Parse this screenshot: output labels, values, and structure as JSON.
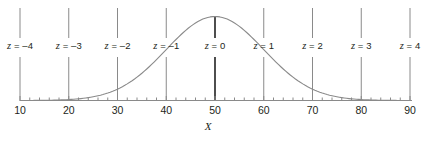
{
  "chart_data": {
    "type": "line",
    "title": "",
    "xlabel": "X",
    "ylabel": "",
    "xlim": [
      10,
      90
    ],
    "ylim": [
      0,
      1
    ],
    "grid": false,
    "legend": null,
    "curve": {
      "name": "normal-density",
      "mean": 50,
      "sd": 10,
      "color": "#8a8a8a"
    },
    "x_axis": {
      "major_ticks": [
        10,
        20,
        30,
        40,
        50,
        60,
        70,
        80,
        90
      ],
      "major_tick_labels": [
        "10",
        "20",
        "30",
        "40",
        "50",
        "60",
        "70",
        "80",
        "90"
      ],
      "minor_tick_step": 2,
      "color": "#8a8a8a"
    },
    "z_gridlines": [
      {
        "z": -4,
        "x": 10,
        "label_var": "z",
        "label_value": "= –4",
        "highlight": false
      },
      {
        "z": -3,
        "x": 20,
        "label_var": "z",
        "label_value": "= –3",
        "highlight": false
      },
      {
        "z": -2,
        "x": 30,
        "label_var": "z",
        "label_value": "= –2",
        "highlight": false
      },
      {
        "z": -1,
        "x": 40,
        "label_var": "z",
        "label_value": "= –1",
        "highlight": false
      },
      {
        "z": 0,
        "x": 50,
        "label_var": "z",
        "label_value": "= 0",
        "highlight": true
      },
      {
        "z": 1,
        "x": 60,
        "label_var": "z",
        "label_value": "= 1",
        "highlight": false
      },
      {
        "z": 2,
        "x": 70,
        "label_var": "z",
        "label_value": "= 2",
        "highlight": false
      },
      {
        "z": 3,
        "x": 80,
        "label_var": "z",
        "label_value": "= 3",
        "highlight": false
      },
      {
        "z": 4,
        "x": 90,
        "label_var": "z",
        "label_value": "= 4",
        "highlight": false
      }
    ],
    "colors": {
      "line": "#8a8a8a",
      "axis": "#8a8a8a",
      "highlight": "#3a3a3a",
      "text": "#231f20"
    }
  }
}
